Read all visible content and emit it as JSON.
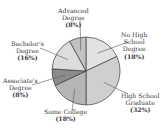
{
  "chart_data": {
    "type": "pie",
    "title": "",
    "categories": [
      "No High School Degree",
      "High School Graduate",
      "Some College",
      "Associate's Degree",
      "Bachelor's Degree",
      "Advanced Degree"
    ],
    "values": [
      18,
      32,
      18,
      8,
      16,
      8
    ],
    "unit": "%",
    "start_angle": "12 o'clock",
    "direction": "clockwise",
    "colors": [
      "#e2e2e2",
      "#cfcfcf",
      "#b5b5b5",
      "#8c8c8c",
      "#dddddd",
      "#c2c2c2"
    ],
    "legend": "none (callout labels)"
  },
  "labels": [
    {
      "line1": "No High",
      "line2": "School",
      "line3": "Degree",
      "pct": "(18%)"
    },
    {
      "line1": "High School",
      "line2": "Graduate",
      "pct": "(32%)"
    },
    {
      "line1": "Some College",
      "pct": "(18%)"
    },
    {
      "line1": "Associate's",
      "line2": "Degree",
      "pct": "(8%)"
    },
    {
      "line1": "Bachelor's",
      "line2": "Degree",
      "pct": "(16%)"
    },
    {
      "line1": "Advanced",
      "line2": "Degree",
      "pct": "(8%)"
    }
  ]
}
